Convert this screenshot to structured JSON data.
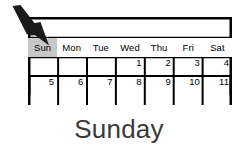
{
  "canvas": {
    "width": 238,
    "height": 151,
    "background": "#ffffff"
  },
  "calendar": {
    "title_bar": "",
    "selected_day": "Sun",
    "highlight_color": "#c8c8c8",
    "border_color": "#000000",
    "columns": [
      {
        "label": "Sun",
        "selected": true
      },
      {
        "label": "Mon",
        "selected": false
      },
      {
        "label": "Tue",
        "selected": false
      },
      {
        "label": "Wed",
        "selected": false
      },
      {
        "label": "Thu",
        "selected": false
      },
      {
        "label": "Fri",
        "selected": false
      },
      {
        "label": "Sat",
        "selected": false
      }
    ],
    "weeks": [
      {
        "days": [
          "",
          "",
          "",
          "1",
          "2",
          "3",
          "4"
        ]
      },
      {
        "days": [
          "5",
          "6",
          "7",
          "8",
          "9",
          "10",
          "11"
        ]
      }
    ]
  },
  "pointer": {
    "icon": "arrow-cursor-icon",
    "color": "#1a1a1a",
    "points_at": "Sun"
  },
  "caption": {
    "text": "Sunday",
    "color": "#3a3a3a"
  }
}
